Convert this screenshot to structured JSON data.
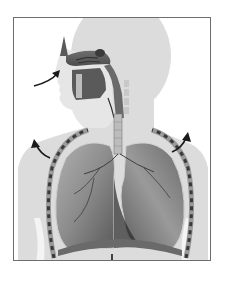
{
  "figure": {
    "caption": "",
    "labels": [],
    "arrows": [
      {
        "id": "inhale-arrow",
        "direction": "into-nose"
      },
      {
        "id": "left-rib-arrow",
        "direction": "up-outward"
      },
      {
        "id": "right-rib-arrow",
        "direction": "up-outward"
      },
      {
        "id": "diaphragm-arrow",
        "direction": "down"
      }
    ],
    "colors": {
      "frame": "#6e6e6e",
      "silhouette": "#dcdcdc",
      "lung_fill": "#8a8a8a",
      "lung_dark": "#4a4a4a",
      "arrow": "#1a1a1a",
      "background": "#ffffff"
    }
  }
}
